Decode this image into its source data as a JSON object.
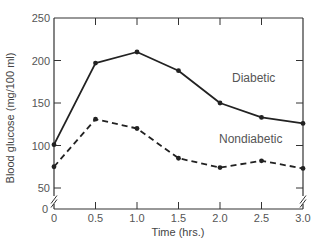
{
  "chart_data": {
    "type": "line",
    "title": "",
    "xlabel": "Time (hrs.)",
    "ylabel": "Blood glucose (mg/100 ml)",
    "x": [
      0,
      0.5,
      1.0,
      1.5,
      2.0,
      2.5,
      3.0
    ],
    "x_tick_labels": [
      "0",
      "0.5",
      "1.0",
      "1.5",
      "2.0",
      "2.5",
      "3.0"
    ],
    "y_tick_labels": [
      "0",
      "50",
      "100",
      "150",
      "200",
      "250"
    ],
    "y_ticks": [
      0,
      50,
      100,
      150,
      200,
      250
    ],
    "xlim": [
      0,
      3.0
    ],
    "ylim": [
      0,
      250
    ],
    "axis_break": "between 0 and 50 on both y-axes",
    "grid": false,
    "legend": "inline labels",
    "series": [
      {
        "name": "Diabetic",
        "style": "solid",
        "color": "#222222",
        "values": [
          101,
          197,
          210,
          188,
          150,
          133,
          126
        ]
      },
      {
        "name": "Nondiabetic",
        "style": "dashed",
        "color": "#222222",
        "values": [
          75,
          131,
          120,
          85,
          74,
          82,
          73
        ]
      }
    ]
  },
  "labels": {
    "diabetic": "Diabetic",
    "nondiabetic": "Nondiabetic",
    "xlabel": "Time (hrs.)",
    "ylabel": "Blood glucose (mg/100 ml)"
  }
}
